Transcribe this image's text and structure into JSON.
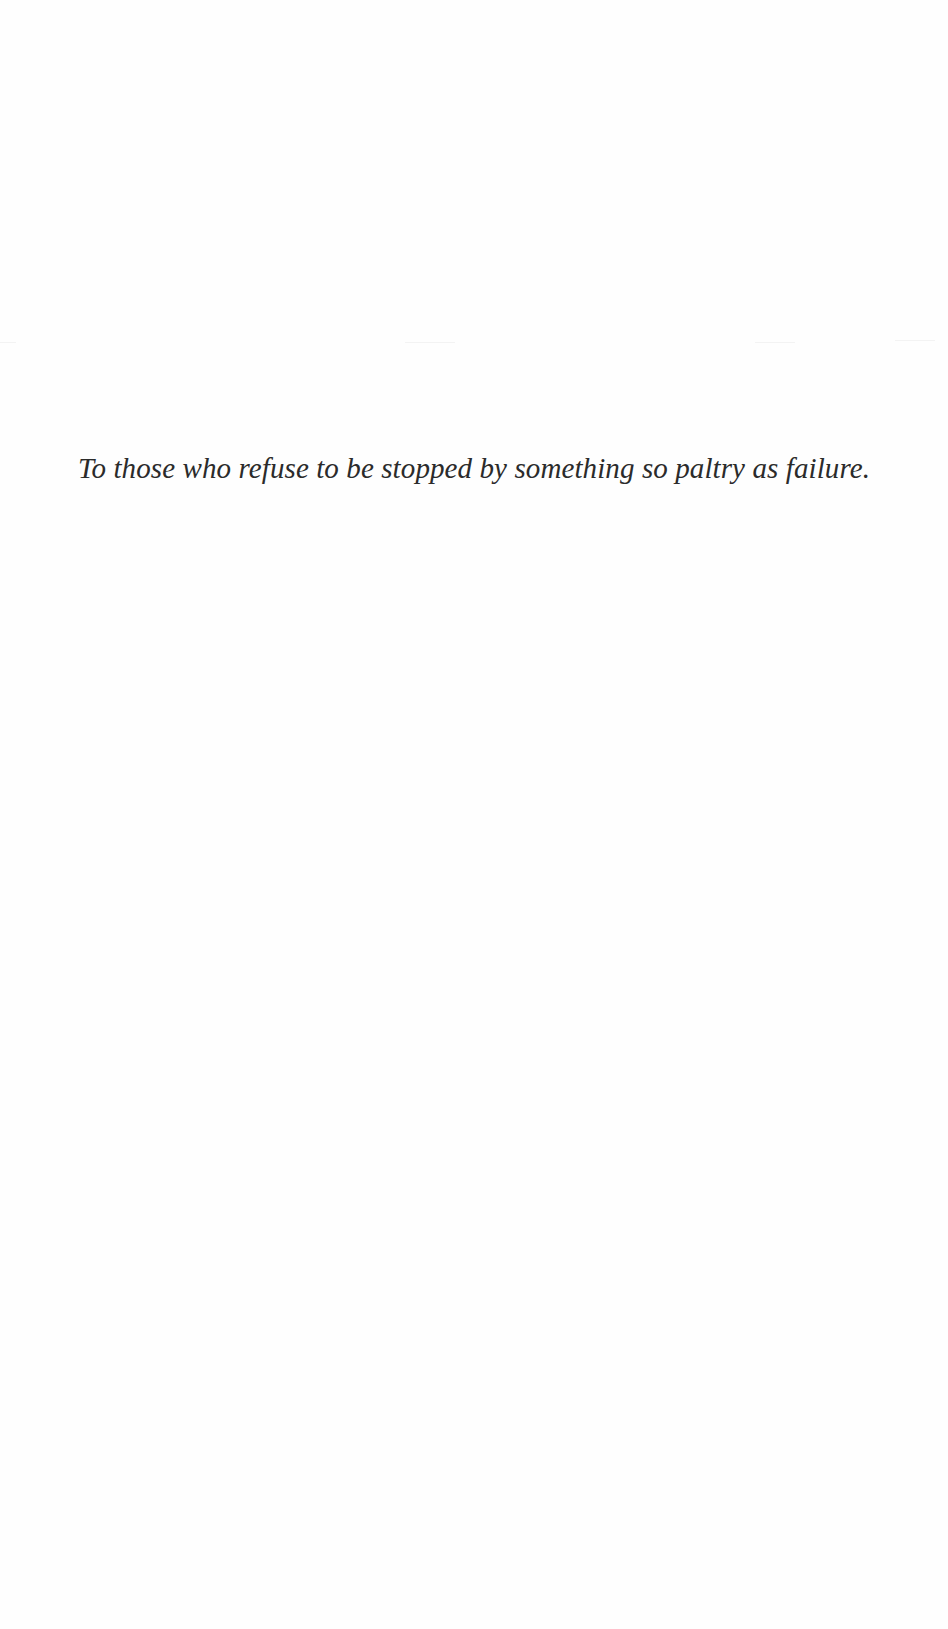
{
  "page": {
    "dedication": "To those who refuse to be stopped by something so paltry as failure."
  }
}
